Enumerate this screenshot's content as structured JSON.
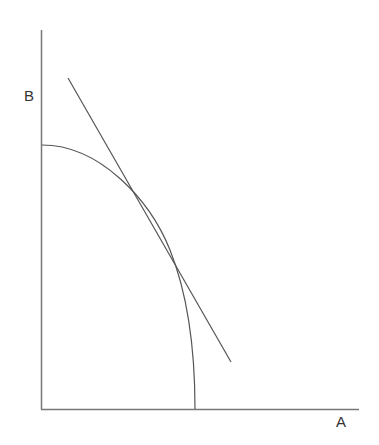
{
  "diagram": {
    "type": "production possibility frontier with tangent line",
    "axes": {
      "x_label": "A",
      "y_label": "B"
    },
    "curve": {
      "description": "concave curve from B-axis intercept to A-axis intercept"
    },
    "tangent_line": {
      "description": "straight line tangent to curve"
    },
    "colors": {
      "stroke": "#555555",
      "text": "#333333"
    }
  }
}
